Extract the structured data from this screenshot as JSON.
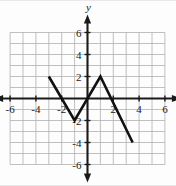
{
  "figure": {
    "name": "coordinate-plane-graph",
    "background_color": "#fdfdfd",
    "grid_color": "#b0b0b0",
    "axis_color": "#1a1a1a",
    "curve_color": "#111111"
  },
  "axes": {
    "x_axis_label": "x",
    "y_axis_label": "y",
    "x_range": [
      -6,
      6
    ],
    "y_range": [
      -6,
      6
    ],
    "grid_step": 1,
    "tick_step": 2,
    "x_tick_labels": [
      "-6",
      "-4",
      "-2",
      "2",
      "4",
      "6"
    ],
    "x_tick_values": [
      -6,
      -4,
      -2,
      2,
      4,
      6
    ],
    "y_tick_labels": [
      "6",
      "4",
      "2",
      "-2",
      "-4",
      "-6"
    ],
    "y_tick_values": [
      6,
      4,
      2,
      -2,
      -4,
      -6
    ],
    "arrowheads": [
      "left",
      "right",
      "up",
      "down"
    ]
  },
  "chart_data": {
    "type": "line",
    "title": "",
    "xlabel": "x",
    "ylabel": "y",
    "xlim": [
      -6,
      6
    ],
    "ylim": [
      -6,
      6
    ],
    "grid": true,
    "legend": "none",
    "series": [
      {
        "name": "piecewise-linear-graph",
        "x": [
          -3,
          -1,
          1,
          3.5
        ],
        "y": [
          2,
          -2,
          2,
          -4
        ],
        "points": [
          {
            "x": -3,
            "y": 2
          },
          {
            "x": -1,
            "y": -2
          },
          {
            "x": 1,
            "y": 2
          },
          {
            "x": 3.5,
            "y": -4
          }
        ]
      }
    ]
  }
}
